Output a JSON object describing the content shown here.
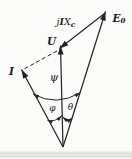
{
  "figure": {
    "background_color": "#fbfbfa",
    "ink_color": "#222222",
    "vectors": {
      "current": {
        "label": "I"
      },
      "voltage": {
        "label": "U"
      },
      "emf": {
        "base": "E",
        "sub": "0"
      },
      "reactance_drop": {
        "j": "j",
        "i": "I",
        "x": "X",
        "sub": "c"
      }
    },
    "angles": {
      "psi": "ψ",
      "phi": "φ",
      "theta": "θ"
    }
  }
}
